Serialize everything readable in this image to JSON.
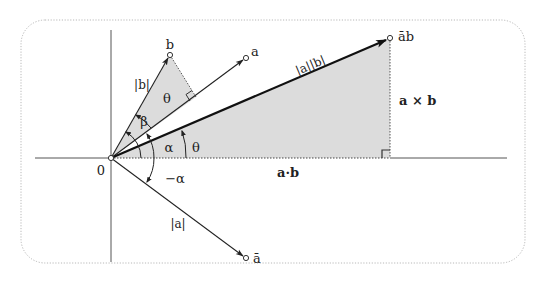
{
  "figure": {
    "colors": {
      "frame": "#b8b8b8",
      "axis": "#555555",
      "vector": "#222222",
      "shade": "#d9d9d9",
      "text": "#222222"
    },
    "origin_label": "0",
    "vectors": {
      "b": {
        "label": "b",
        "length_label": "|b|"
      },
      "a": {
        "label": "a"
      },
      "a_conj": {
        "label": "ā",
        "length_label": "|a|"
      },
      "a_conj_b": {
        "label": "āb",
        "length_label": "|a||b|"
      }
    },
    "angles": {
      "theta_upper": "θ",
      "beta": "β",
      "alpha": "α",
      "theta_lower": "θ",
      "neg_alpha": "−α"
    },
    "products": {
      "dot": "a·b",
      "cross": "a × b"
    }
  }
}
